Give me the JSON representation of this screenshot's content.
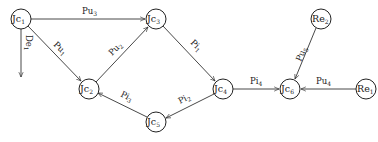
{
  "diagram": {
    "type": "directed-graph",
    "nodes": [
      {
        "id": "Jc1",
        "base": "Jc",
        "sub": "1",
        "x": 21,
        "y": 19
      },
      {
        "id": "Jc3",
        "base": "Jc",
        "sub": "3",
        "x": 156,
        "y": 19
      },
      {
        "id": "Jc2",
        "base": "Jc",
        "sub": "2",
        "x": 89,
        "y": 89
      },
      {
        "id": "Jc4",
        "base": "Jc",
        "sub": "4",
        "x": 223,
        "y": 89
      },
      {
        "id": "Jc5",
        "base": "Jc",
        "sub": "5",
        "x": 156,
        "y": 122
      },
      {
        "id": "Jc6",
        "base": "Jc",
        "sub": "6",
        "x": 290,
        "y": 89
      },
      {
        "id": "Re2",
        "base": "Re",
        "sub": "2",
        "x": 321,
        "y": 19
      },
      {
        "id": "Re1",
        "base": "Re",
        "sub": "1",
        "x": 366,
        "y": 89
      }
    ],
    "edges": [
      {
        "from": "Jc1",
        "to": "Jc3",
        "base": "Pu",
        "sub": "3"
      },
      {
        "from": "Jc1",
        "to": "Jc2",
        "base": "Pu",
        "sub": "1"
      },
      {
        "from": "Jc2",
        "to": "Jc3",
        "base": "Pu",
        "sub": "2"
      },
      {
        "from": "Jc3",
        "to": "Jc4",
        "base": "Pi",
        "sub": "1"
      },
      {
        "from": "Jc4",
        "to": "Jc5",
        "base": "Pi",
        "sub": "2"
      },
      {
        "from": "Jc5",
        "to": "Jc2",
        "base": "Pi",
        "sub": "3"
      },
      {
        "from": "Jc4",
        "to": "Jc6",
        "base": "Pi",
        "sub": "4"
      },
      {
        "from": "Re2",
        "to": "Jc6",
        "base": "Pu",
        "sub": "5"
      },
      {
        "from": "Re1",
        "to": "Jc6",
        "base": "Pu",
        "sub": "4"
      },
      {
        "from": "Jc1",
        "to": "sink",
        "base": "De",
        "sub": "1"
      }
    ]
  }
}
